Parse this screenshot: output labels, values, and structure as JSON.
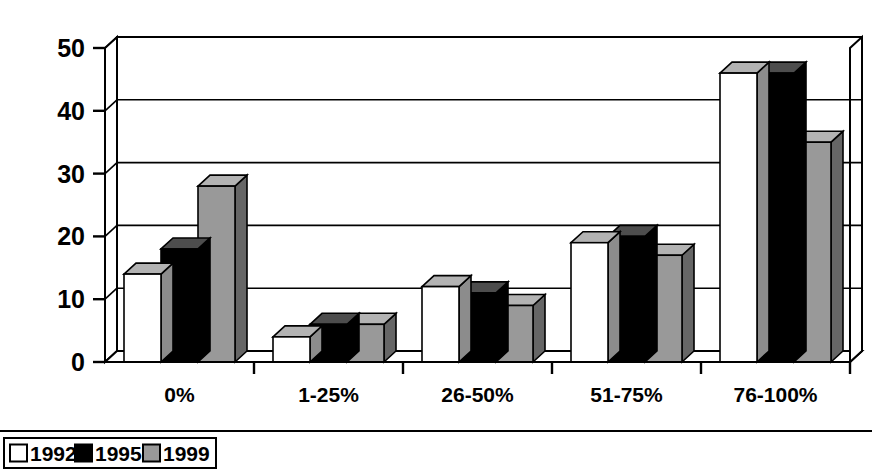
{
  "chart_data": {
    "type": "bar",
    "title": "",
    "subtitle": "",
    "xlabel": "",
    "ylabel": "",
    "categories": [
      "0%",
      "1-25%",
      "26-50%",
      "51-75%",
      "76-100%"
    ],
    "series": [
      {
        "name": "1992",
        "color": "#ffffff",
        "values": [
          14,
          4,
          12,
          19,
          46
        ]
      },
      {
        "name": "1995",
        "color": "#000000",
        "values": [
          18,
          6,
          11,
          20,
          46
        ]
      },
      {
        "name": "1999",
        "color": "#999999",
        "values": [
          28,
          6,
          9,
          17,
          35
        ]
      }
    ],
    "ylim": [
      0,
      50
    ],
    "ytick_labels": [
      "0",
      "10",
      "20",
      "30",
      "40",
      "50"
    ],
    "ytick_values": [
      0,
      10,
      20,
      30,
      40,
      50
    ],
    "grid": true,
    "legend_position": "bottom-left",
    "style": "3d-column",
    "annotations": []
  },
  "legend": {
    "entries": [
      {
        "label": "1992",
        "swatch": "white-swatch"
      },
      {
        "label": "1995",
        "swatch": "black-swatch"
      },
      {
        "label": "1999",
        "swatch": "gray-swatch"
      }
    ]
  },
  "colors": {
    "series_1992": "#ffffff",
    "series_1995": "#000000",
    "series_1999": "#999999",
    "top_face_1992": "#b3b3b3",
    "side_face_1992": "#8c8c8c",
    "top_face_1995": "#4d4d4d",
    "side_face_1995": "#000000",
    "top_face_1999": "#b3b3b3",
    "side_face_1999": "#666666",
    "outline": "#000000",
    "background": "#ffffff",
    "floor": "#ffffff"
  }
}
